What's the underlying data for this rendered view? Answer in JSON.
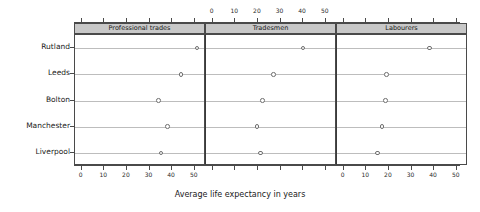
{
  "chart_data": {
    "type": "scatter",
    "title": "",
    "subtitle": "",
    "xlabel": "Average life expectancy in years",
    "ylabel": "",
    "categories": [
      "Rutland",
      "Leeds",
      "Bolton",
      "Manchester",
      "Liverpool"
    ],
    "panels": [
      {
        "label": "Professional trades",
        "values": [
          51,
          44,
          34,
          38,
          35
        ]
      },
      {
        "label": "Tradesmen",
        "values": [
          40,
          27,
          22,
          19.5,
          21
        ]
      },
      {
        "label": "Labourers",
        "values": [
          38,
          19,
          18.5,
          17,
          15
        ]
      }
    ],
    "xlim": [
      -3,
      55
    ],
    "xticks": [
      0,
      10,
      20,
      30,
      40,
      50
    ],
    "xticklabels": [
      "0",
      "10",
      "20",
      "30",
      "40",
      "50"
    ],
    "top_axis": true,
    "bottom_axis": true,
    "grid": "horizontal-row-lines",
    "legend": "none",
    "marker": "open-circle",
    "colors": {
      "strip_background": "#c8c8c8",
      "frame": "#4a4a4a",
      "rowline": "#bdbdbd",
      "marker_edge": "#6e6e6e",
      "marker_fill": "#ffffff",
      "text": "#1a1a1a"
    }
  }
}
